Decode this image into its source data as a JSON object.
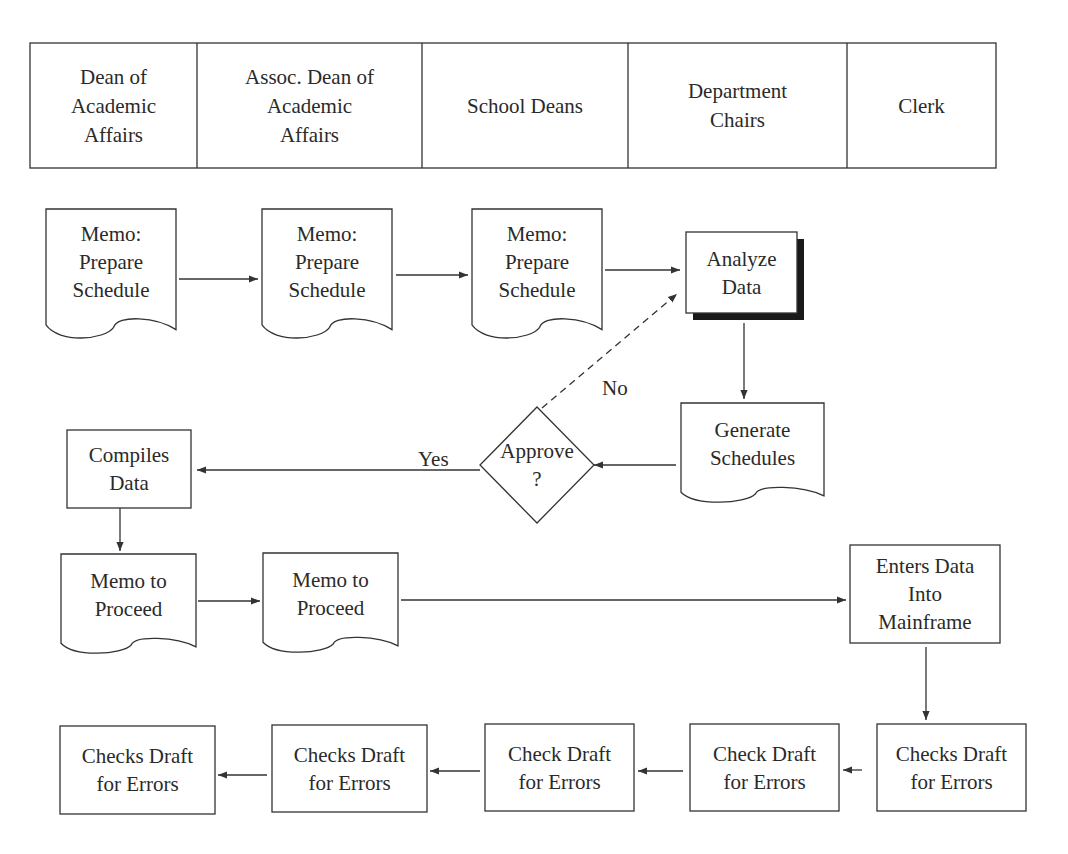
{
  "header": {
    "lanes": [
      {
        "label": [
          "Dean of",
          "Academic",
          "Affairs"
        ],
        "x0": 30,
        "x1": 197
      },
      {
        "label": [
          "Assoc. Dean of",
          "Academic",
          "Affairs"
        ],
        "x0": 197,
        "x1": 422
      },
      {
        "label": [
          "School Deans"
        ],
        "x0": 422,
        "x1": 628
      },
      {
        "label": [
          "Department",
          "Chairs"
        ],
        "x0": 628,
        "x1": 847
      },
      {
        "label": [
          "Clerk"
        ],
        "x0": 847,
        "x1": 996
      }
    ]
  },
  "nodes": [
    {
      "id": "memo1",
      "type": "document",
      "x": 46,
      "y": 209,
      "w": 130,
      "h": 130,
      "label": [
        "Memo:",
        "Prepare",
        "Schedule"
      ]
    },
    {
      "id": "memo2",
      "type": "document",
      "x": 262,
      "y": 209,
      "w": 130,
      "h": 130,
      "label": [
        "Memo:",
        "Prepare",
        "Schedule"
      ]
    },
    {
      "id": "memo3",
      "type": "document",
      "x": 472,
      "y": 209,
      "w": 130,
      "h": 130,
      "label": [
        "Memo:",
        "Prepare",
        "Schedule"
      ]
    },
    {
      "id": "analyze",
      "type": "process-shadow",
      "x": 686,
      "y": 232,
      "w": 111,
      "h": 81,
      "label": [
        "Analyze",
        "Data"
      ]
    },
    {
      "id": "generate",
      "type": "document",
      "x": 681,
      "y": 403,
      "w": 143,
      "h": 100,
      "label": [
        "Generate",
        "Schedules"
      ]
    },
    {
      "id": "approve",
      "type": "decision",
      "x": 480,
      "y": 407,
      "w": 114,
      "h": 116,
      "label": [
        "Approve",
        "?"
      ]
    },
    {
      "id": "compiles",
      "type": "process",
      "x": 67,
      "y": 430,
      "w": 124,
      "h": 78,
      "label": [
        "Compiles",
        "Data"
      ]
    },
    {
      "id": "proceed1",
      "type": "document",
      "x": 61,
      "y": 554,
      "w": 135,
      "h": 100,
      "label": [
        "Memo to",
        "Proceed"
      ]
    },
    {
      "id": "proceed2",
      "type": "document",
      "x": 263,
      "y": 553,
      "w": 135,
      "h": 100,
      "label": [
        "Memo to",
        "Proceed"
      ]
    },
    {
      "id": "mainframe",
      "type": "process",
      "x": 850,
      "y": 545,
      "w": 150,
      "h": 98,
      "label": [
        "Enters Data",
        "Into",
        "Mainframe"
      ]
    },
    {
      "id": "check5",
      "type": "process",
      "x": 877,
      "y": 724,
      "w": 149,
      "h": 87,
      "label": [
        "Checks Draft",
        "for Errors"
      ]
    },
    {
      "id": "check4",
      "type": "process",
      "x": 690,
      "y": 724,
      "w": 149,
      "h": 87,
      "label": [
        "Check Draft",
        "for Errors"
      ]
    },
    {
      "id": "check3",
      "type": "process",
      "x": 485,
      "y": 724,
      "w": 149,
      "h": 87,
      "label": [
        "Check Draft",
        "for Errors"
      ]
    },
    {
      "id": "check2",
      "type": "process",
      "x": 272,
      "y": 725,
      "w": 155,
      "h": 87,
      "label": [
        "Checks Draft",
        "for Errors"
      ]
    },
    {
      "id": "check1",
      "type": "process",
      "x": 60,
      "y": 726,
      "w": 155,
      "h": 88,
      "label": [
        "Checks Draft",
        "for Errors"
      ]
    }
  ],
  "edges": [
    {
      "from": "memo1",
      "to": "memo2",
      "points": [
        [
          179,
          279
        ],
        [
          258,
          279
        ]
      ],
      "style": "solid"
    },
    {
      "from": "memo2",
      "to": "memo3",
      "points": [
        [
          396,
          275
        ],
        [
          468,
          275
        ]
      ],
      "style": "solid"
    },
    {
      "from": "memo3",
      "to": "analyze",
      "points": [
        [
          605,
          270
        ],
        [
          680,
          270
        ]
      ],
      "style": "solid"
    },
    {
      "from": "analyze",
      "to": "generate",
      "points": [
        [
          744,
          323
        ],
        [
          744,
          399
        ]
      ],
      "style": "solid"
    },
    {
      "from": "generate",
      "to": "approve",
      "points": [
        [
          676,
          465
        ],
        [
          594,
          465
        ]
      ],
      "style": "solid"
    },
    {
      "from": "approve",
      "to": "analyze",
      "points": [
        [
          542,
          408
        ],
        [
          677,
          294
        ]
      ],
      "style": "dashed",
      "label": "No",
      "label_x": 602,
      "label_y": 395
    },
    {
      "from": "approve",
      "to": "compiles",
      "points": [
        [
          480,
          470
        ],
        [
          197,
          470
        ]
      ],
      "style": "solid",
      "label": "Yes",
      "label_x": 418,
      "label_y": 466
    },
    {
      "from": "compiles",
      "to": "proceed1",
      "points": [
        [
          120,
          508
        ],
        [
          120,
          551
        ]
      ],
      "style": "solid"
    },
    {
      "from": "proceed1",
      "to": "proceed2",
      "points": [
        [
          198,
          601
        ],
        [
          260,
          601
        ]
      ],
      "style": "solid"
    },
    {
      "from": "proceed2",
      "to": "mainframe",
      "points": [
        [
          401,
          600
        ],
        [
          846,
          600
        ]
      ],
      "style": "solid"
    },
    {
      "from": "mainframe",
      "to": "check5",
      "points": [
        [
          926,
          647
        ],
        [
          926,
          720
        ]
      ],
      "style": "solid"
    },
    {
      "from": "check5",
      "to": "check4",
      "points": [
        [
          862,
          770
        ],
        [
          843,
          770
        ]
      ],
      "style": "solid"
    },
    {
      "from": "check4",
      "to": "check3",
      "points": [
        [
          683,
          771
        ],
        [
          638,
          771
        ]
      ],
      "style": "solid"
    },
    {
      "from": "check3",
      "to": "check2",
      "points": [
        [
          480,
          771
        ],
        [
          430,
          771
        ]
      ],
      "style": "solid"
    },
    {
      "from": "check2",
      "to": "check1",
      "points": [
        [
          267,
          775
        ],
        [
          218,
          775
        ]
      ],
      "style": "solid"
    }
  ],
  "colors": {
    "stroke": "#333333",
    "shadow": "#1a1a1a",
    "background": "#ffffff"
  }
}
